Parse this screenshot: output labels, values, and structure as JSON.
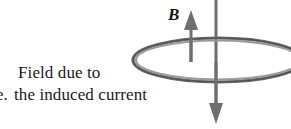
{
  "figure": {
    "caption": {
      "item_label": "e.",
      "line1": "Field due to",
      "line2": "the induced current"
    },
    "field_label": "B",
    "colors": {
      "coil": "#7a7a7a",
      "coil_dark": "#5d5d5d",
      "arrow": "#6e6e6e",
      "text": "#1a1a1a"
    },
    "elements": {
      "coil_name": "current-loop-ellipse",
      "up_arrow_name": "induced-field-arrow-up",
      "down_arrow_name": "external-field-arrow-down"
    }
  }
}
